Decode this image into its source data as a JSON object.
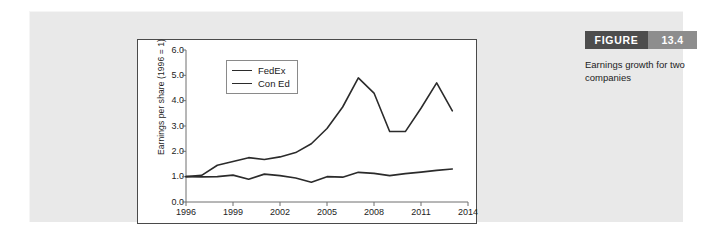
{
  "figure": {
    "label_word": "FIGURE",
    "number": "13.4",
    "caption": "Earnings growth for two companies",
    "header_dark_color": "#4d4d4d",
    "header_light_color": "#8d8d8d",
    "panel_color": "#e8e8e8"
  },
  "chart_data": {
    "type": "line",
    "title": "",
    "xlabel": "",
    "ylabel": "Earnings per share (1996 = 1)",
    "xlim": [
      1996,
      2014
    ],
    "ylim": [
      0.0,
      6.0
    ],
    "grid": false,
    "legend_position": "upper-left-inside",
    "x_tick_labels": [
      "1996",
      "1999",
      "2002",
      "2005",
      "2008",
      "2011",
      "2014"
    ],
    "x_tick_values": [
      1996,
      1999,
      2002,
      2005,
      2008,
      2011,
      2014
    ],
    "y_tick_labels": [
      "0.0",
      "1.0",
      "2.0",
      "3.0",
      "4.0",
      "5.0",
      "6.0"
    ],
    "y_tick_values": [
      0.0,
      1.0,
      2.0,
      3.0,
      4.0,
      5.0,
      6.0
    ],
    "x": [
      1996,
      1997,
      1998,
      1999,
      2000,
      2001,
      2002,
      2003,
      2004,
      2005,
      2006,
      2007,
      2008,
      2009,
      2010,
      2011,
      2012,
      2013
    ],
    "series": [
      {
        "name": "FedEx",
        "color": "#2b2b2b",
        "values": [
          1.0,
          1.05,
          1.45,
          1.6,
          1.75,
          1.68,
          1.78,
          1.95,
          2.3,
          2.9,
          3.75,
          4.9,
          4.3,
          2.78,
          2.78,
          3.7,
          4.7,
          3.6
        ]
      },
      {
        "name": "Con Ed",
        "color": "#2b2b2b",
        "values": [
          1.0,
          0.99,
          1.0,
          1.06,
          0.9,
          1.1,
          1.04,
          0.95,
          0.78,
          1.0,
          0.98,
          1.17,
          1.13,
          1.04,
          1.12,
          1.18,
          1.25,
          1.3
        ]
      }
    ],
    "legend_entries": [
      "FedEx",
      "Con Ed"
    ]
  }
}
